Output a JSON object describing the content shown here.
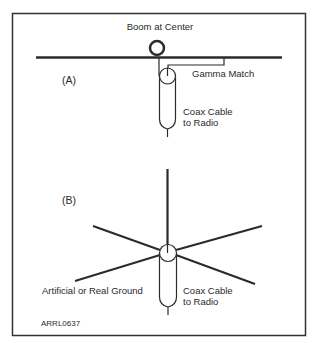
{
  "figure_id": "ARRL0637",
  "colors": {
    "stroke": "#2b2b2b",
    "frame": "#333333",
    "background": "#ffffff",
    "text": "#2a2a2a"
  },
  "panel_a": {
    "label": "(A)",
    "boom_label": "Boom at Center",
    "gamma_label": "Gamma Match",
    "coax_label_line1": "Coax Cable",
    "coax_label_line2": "to Radio"
  },
  "panel_b": {
    "label": "(B)",
    "ground_label": "Artificial or Real Ground",
    "coax_label_line1": "Coax Cable",
    "coax_label_line2": "to Radio"
  }
}
